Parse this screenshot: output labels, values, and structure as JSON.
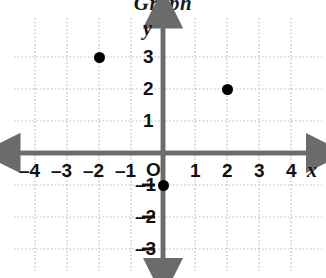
{
  "title": "Graph",
  "axis_labels": {
    "x": "x",
    "y": "y",
    "origin": "O"
  },
  "colors": {
    "axis": "#6b6b6b",
    "grid": "#b9b9b9",
    "point": "#000000",
    "text": "#111111",
    "background": "#ffffff"
  },
  "x_tick_labels": [
    "–4",
    "–3",
    "–2",
    "–1",
    "1",
    "2",
    "3",
    "4"
  ],
  "y_tick_labels": [
    "3",
    "2",
    "1",
    "–1",
    "–2",
    "–3"
  ],
  "chart_data": {
    "type": "scatter",
    "title": "Graph",
    "xlabel": "x",
    "ylabel": "y",
    "xlim": [
      -4.8,
      4.8
    ],
    "ylim": [
      -3.8,
      3.6
    ],
    "xticks": [
      -4,
      -3,
      -2,
      -1,
      0,
      1,
      2,
      3,
      4
    ],
    "yticks": [
      -3,
      -2,
      -1,
      0,
      1,
      2,
      3
    ],
    "xtick_labels": [
      "–4",
      "–3",
      "–2",
      "–1",
      "O",
      "1",
      "2",
      "3",
      "4"
    ],
    "ytick_labels": [
      "–3",
      "–2",
      "–1",
      "O",
      "1",
      "2",
      "3"
    ],
    "grid": true,
    "grid_style": "dotted",
    "legend": "none",
    "points": [
      {
        "x": -2,
        "y": 3,
        "label": "(–2, 3)"
      },
      {
        "x": 2,
        "y": 2,
        "label": "(2, 2)"
      },
      {
        "x": 0,
        "y": -1,
        "label": "(0, –1)"
      }
    ],
    "series": [
      {
        "name": "plotted points",
        "x": [
          -2,
          2,
          0
        ],
        "y": [
          3,
          2,
          -1
        ],
        "marker": "filled-circle",
        "color": "#000000"
      }
    ]
  }
}
